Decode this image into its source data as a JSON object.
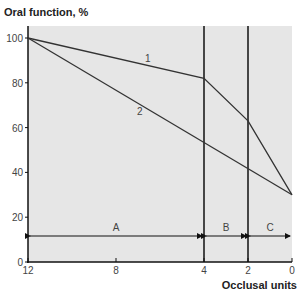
{
  "chart_data": {
    "type": "line",
    "title": "",
    "ylabel": "Oral function, %",
    "xlabel": "Occlusal units",
    "xlim": [
      12,
      0
    ],
    "ylim": [
      0,
      100
    ],
    "x_ticks": [
      "12",
      "8",
      "4",
      "2",
      "0"
    ],
    "y_ticks": [
      "0",
      "20",
      "40",
      "60",
      "80",
      "100"
    ],
    "grid": false,
    "series": [
      {
        "name": "1",
        "x": [
          12,
          4,
          2,
          0
        ],
        "values": [
          100,
          82,
          63,
          30
        ]
      },
      {
        "name": "2",
        "x": [
          12,
          0
        ],
        "values": [
          100,
          30
        ]
      }
    ],
    "vertical_lines": [
      4,
      2
    ],
    "regions": [
      {
        "label": "A",
        "from": 12,
        "to": 4
      },
      {
        "label": "B",
        "from": 4,
        "to": 2
      },
      {
        "label": "C",
        "from": 2,
        "to": 0
      }
    ],
    "background": "#e6e6e6",
    "line_color": "#333333"
  }
}
